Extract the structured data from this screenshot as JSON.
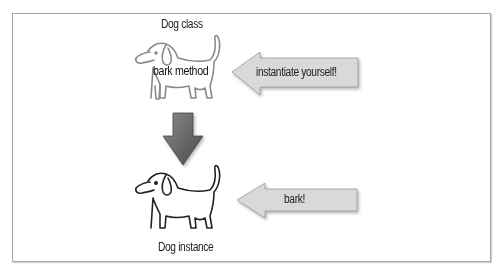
{
  "diagram": {
    "class_node": {
      "title": "Dog class",
      "member_label": "bark method"
    },
    "instance_node": {
      "title": "Dog instance"
    },
    "arrows": [
      {
        "id": "instantiate",
        "label": "instantiate yourself!",
        "direction": "left",
        "target": "class_node"
      },
      {
        "id": "instantiation",
        "label": "",
        "direction": "down",
        "from": "class_node",
        "to": "instance_node"
      },
      {
        "id": "bark",
        "label": "bark!",
        "direction": "left",
        "target": "instance_node"
      }
    ],
    "colors": {
      "frame": "#a8a8a8",
      "arrow_fill": "#d9d9d9",
      "down_arrow_fill": "#6a6a6a",
      "dog_class_stroke": "#8a8a8a",
      "dog_instance_stroke": "#222222"
    }
  }
}
